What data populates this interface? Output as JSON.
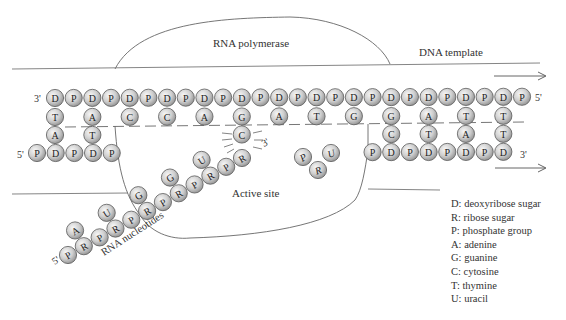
{
  "labels": {
    "rna_polymerase": "RNA polymerase",
    "dna_template": "DNA template",
    "active_site": "Active site",
    "rna_nucleotides": "RNA nucleotides",
    "top_strand_left_end": "3'",
    "top_strand_right_end": "5'",
    "bottom_strand_left_end": "5'",
    "bottom_strand_right_end": "3'",
    "rna_3_end": "3'",
    "rna_5_end": "5'"
  },
  "legend": [
    "D: deoxyribose sugar",
    "R: ribose sugar",
    "P: phosphate group",
    "A: adenine",
    "G: guanine",
    "C: cytosine",
    "T: thymine",
    "U: uracil"
  ],
  "colors": {
    "bead_fill_light": "#f2f2f2",
    "bead_fill_dark": "#9a9a9a",
    "bead_stroke": "#555555",
    "line": "#555555"
  },
  "dna_top_strand": {
    "backbone": [
      "D",
      "P",
      "D",
      "P",
      "D",
      "P",
      "D",
      "P",
      "D",
      "P",
      "D",
      "P",
      "D",
      "P",
      "D",
      "P",
      "D",
      "P",
      "D",
      "P",
      "D",
      "P",
      "D",
      "P",
      "D",
      "P"
    ],
    "bases_row1": {
      "0": "T",
      "2": "A",
      "4": "C",
      "6": "C",
      "8": "A",
      "10": "G",
      "12": "A",
      "14": "T",
      "16": "G",
      "18": "G",
      "20": "A",
      "22": "T",
      "24": "T"
    }
  },
  "pairing_row": {
    "0": "A",
    "2": "T",
    "10": "C",
    "18": "C",
    "20": "T",
    "22": "A",
    "24": "T"
  },
  "dna_bottom_left_strand": [
    "P",
    "D",
    "P",
    "D",
    "P"
  ],
  "dna_bottom_right_strand": [
    "P",
    "D",
    "P",
    "D",
    "P",
    "D",
    "P",
    "D"
  ],
  "rna_chain": {
    "backbone": [
      "P",
      "R",
      "P",
      "R",
      "P",
      "R",
      "P",
      "R",
      "P",
      "R",
      "P",
      "R"
    ],
    "bases": {
      "1": "A",
      "3": "U",
      "5": "G",
      "7": "G",
      "9": "U",
      "11": "C"
    }
  },
  "free_nucleotide": [
    "P",
    "R",
    "U"
  ]
}
